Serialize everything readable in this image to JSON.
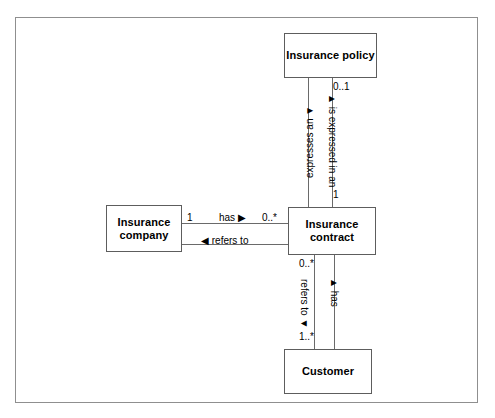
{
  "diagram": {
    "frame_border_color": "#8f8f8f",
    "box_border_color": "#5d5d5d",
    "line_color": "#6a6a6a",
    "background": "#ffffff",
    "entities": [
      {
        "id": "policy",
        "label": "Insurance policy"
      },
      {
        "id": "company",
        "label": "Insurance company"
      },
      {
        "id": "contract",
        "label": "Insurance contract"
      },
      {
        "id": "customer",
        "label": "Customer"
      }
    ],
    "associations": [
      {
        "id": "policy-contract",
        "from": "Insurance policy",
        "to": "Insurance contract",
        "from_multiplicity": "0..1",
        "to_multiplicity": "1",
        "forward_role": "▲ is expressed in an",
        "reverse_role": "expresses an ▼"
      },
      {
        "id": "company-contract",
        "from": "Insurance company",
        "to": "Insurance contract",
        "from_multiplicity": "1",
        "to_multiplicity": "0..*",
        "forward_role": "has ▶",
        "reverse_role": "◀ refers to"
      },
      {
        "id": "contract-customer",
        "from": "Insurance contract",
        "to": "Customer",
        "from_multiplicity": "0..*",
        "to_multiplicity": "1..*",
        "forward_role": "▲ has",
        "reverse_role": "refers to ▼"
      }
    ],
    "labels": {
      "policy_name": "Insurance policy",
      "company_name_line1": "Insurance",
      "company_name_line2": "company",
      "contract_name_line1": "Insurance",
      "contract_name_line2": "contract",
      "customer_name": "Customer",
      "mult_policy_side": "0..1",
      "mult_contract_top": "1",
      "mult_company_side": "1",
      "mult_contract_left": "0..*",
      "mult_contract_bottom": "0..*",
      "mult_customer_top": "1..*",
      "role_has_horizontal": "has ▶",
      "role_refers_to_horizontal": "◀ refers to",
      "role_expresses_an": "expresses an ▼",
      "role_is_expressed_in_an": "▲ is expressed in an",
      "role_refers_to_vertical": "refers to ▼",
      "role_has_vertical": "▲ has"
    }
  }
}
